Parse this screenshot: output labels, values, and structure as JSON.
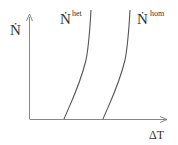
{
  "diagram": {
    "y_axis_label": "Ṅ",
    "x_axis_label": "ΔT",
    "curves": [
      {
        "name": "het",
        "label_base": "Ṅ",
        "label_sup": "het"
      },
      {
        "name": "hom",
        "label_base": "Ṅ",
        "label_sup": "hom"
      }
    ],
    "colors": {
      "line": "#555555",
      "axis": "#777777",
      "text": "#333333"
    }
  }
}
